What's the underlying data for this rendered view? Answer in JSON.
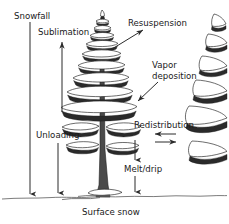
{
  "figure": {
    "caption": "Surface snow",
    "background_color": "#ffffff",
    "line_color": "#2b2b2b",
    "text_color": "#1a1a1a"
  },
  "labels": {
    "snowfall": "Snowfall",
    "sublimation": "Sublimation",
    "resuspension": "Resuspension",
    "vapor_deposition_line1": "Vapor",
    "vapor_deposition_line2": "deposition",
    "unloading": "Unloading",
    "redistribution": "Redistribution",
    "melt_drip": "Melt/drip",
    "surface_snow": "Surface snow"
  },
  "arrows": [
    {
      "name": "snowfall-arrow",
      "direction": "down",
      "from_label": "snowfall",
      "to": "surface snow"
    },
    {
      "name": "sublimation-arrow",
      "direction": "up",
      "from_label": "canopy",
      "to": "atmosphere"
    },
    {
      "name": "resuspension-arrow",
      "direction": "up-right",
      "from_label": "canopy",
      "to": "atmosphere"
    },
    {
      "name": "vapor-deposition-arrow",
      "direction": "down-left",
      "from_label": "atmosphere",
      "to": "canopy"
    },
    {
      "name": "unloading-arrow",
      "direction": "down",
      "from_label": "canopy",
      "to": "surface snow"
    },
    {
      "name": "redistribution-arrow-left",
      "direction": "left",
      "from_label": "surface",
      "to": "surface"
    },
    {
      "name": "redistribution-arrow-right",
      "direction": "right",
      "from_label": "surface",
      "to": "surface"
    },
    {
      "name": "melt-drip-arrow-upper",
      "direction": "down",
      "from_label": "canopy",
      "to": "melt/drip"
    },
    {
      "name": "melt-drip-arrow-lower",
      "direction": "down",
      "from_label": "melt/drip",
      "to": "surface snow"
    }
  ],
  "objects": [
    {
      "name": "main-conifer-tree",
      "description": "snow-laden conifer at center"
    },
    {
      "name": "secondary-conifer-tree",
      "description": "partially cropped conifer at right edge"
    },
    {
      "name": "ground-line",
      "description": "undulating snow surface line"
    }
  ]
}
